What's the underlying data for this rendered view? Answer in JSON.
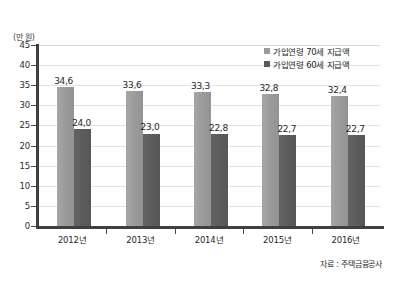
{
  "chart_data": {
    "type": "bar",
    "title": "",
    "subtitle": "",
    "xlabel": "",
    "ylabel": "",
    "unit_label": "(만 원)",
    "categories": [
      "2012년",
      "2013년",
      "2014년",
      "2015년",
      "2016년"
    ],
    "series": [
      {
        "name": "가입연령 70세 지급액",
        "color": "#9a9a9a",
        "values": [
          34.6,
          33.6,
          33.3,
          32.8,
          32.4
        ],
        "labels": [
          "34,6",
          "33,6",
          "33,3",
          "32,8",
          "32,4"
        ]
      },
      {
        "name": "가입연령 60세 지급액",
        "color": "#5b5b5b",
        "values": [
          24.0,
          23.0,
          22.8,
          22.7,
          22.7
        ],
        "labels": [
          "24,0",
          "23,0",
          "22,8",
          "22,7",
          "22,7"
        ]
      }
    ],
    "ylim": [
      0,
      45
    ],
    "yticks": [
      0,
      5,
      10,
      15,
      20,
      25,
      30,
      35,
      40,
      45
    ],
    "ytick_labels": [
      "0",
      "5",
      "10",
      "15",
      "20",
      "25",
      "30",
      "35",
      "40",
      "45"
    ],
    "grid": true,
    "legend_position": "top-right",
    "source_note": "자료 : 주택금융공사"
  }
}
